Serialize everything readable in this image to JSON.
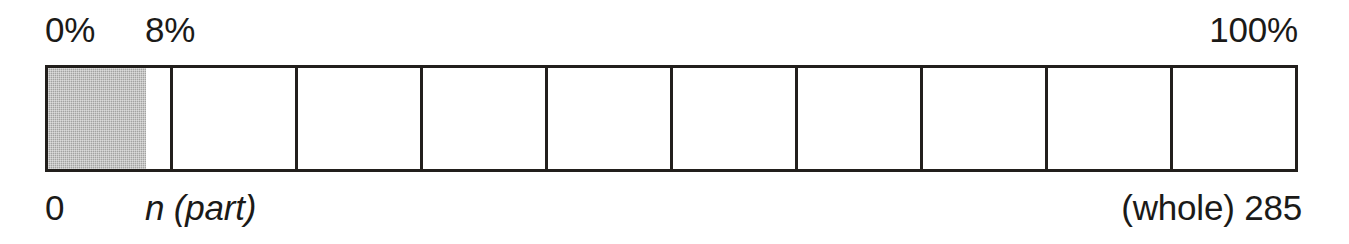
{
  "figure": {
    "title_visible": false,
    "scale_top": {
      "start_label": "0%",
      "part_label": "8%",
      "end_label": "100%"
    },
    "scale_bottom": {
      "start_label": "0",
      "part_label": "n (part)",
      "end_label": "(whole) 285"
    },
    "bar": {
      "cell_count": 10,
      "filled_percent": 8,
      "fill_color": "#a3a3a1",
      "border_color": "#221f1c",
      "cell_background": "#ffffff"
    }
  },
  "chart_data": {
    "type": "bar",
    "title": "",
    "subtitle": "",
    "xlabel": "",
    "ylabel": "",
    "orientation": "horizontal",
    "categories": [
      "percent of whole"
    ],
    "values": [
      8
    ],
    "ylim": [
      0,
      100
    ],
    "axis_ticks_top": [
      "0%",
      "8%",
      "100%"
    ],
    "axis_ticks_bottom": [
      "0",
      "n (part)",
      "(whole) 285"
    ],
    "whole_value": 285,
    "part_value_label": "n (part)",
    "part_percent": 8,
    "segments": 10,
    "segment_percent": 10,
    "grid": false,
    "legend": "none",
    "annotations": [
      "0%",
      "8%",
      "100%",
      "0",
      "n (part)",
      "(whole) 285"
    ]
  }
}
